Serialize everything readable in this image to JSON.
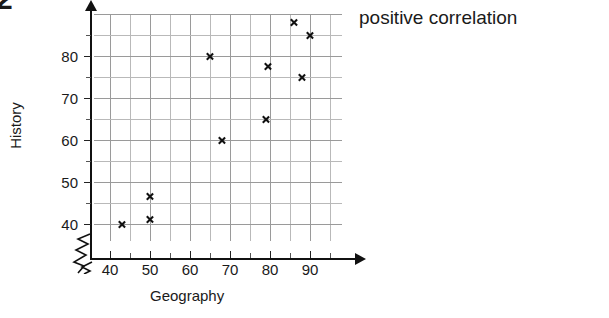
{
  "question_number": "2",
  "conclusion_text": "positive correlation",
  "chart_data": {
    "type": "scatter",
    "title": "",
    "xlabel": "Geography",
    "ylabel": "History",
    "xlim": [
      36,
      100
    ],
    "ylim": [
      36,
      90
    ],
    "xticks": [
      40,
      50,
      60,
      70,
      80,
      90
    ],
    "yticks": [
      40,
      50,
      60,
      70,
      80
    ],
    "xtick_labels": [
      "40",
      "50",
      "60",
      "70",
      "80",
      "90"
    ],
    "ytick_labels": [
      "40",
      "50",
      "60",
      "70",
      "80"
    ],
    "minor_tick_step": 5,
    "grid": true,
    "axis_break": true,
    "legend": "none",
    "marker": "x",
    "marker_color": "#111111",
    "grid_color": "#b9b9b9",
    "axis_color": "#111111",
    "points": [
      {
        "x": 43,
        "y": 40
      },
      {
        "x": 50,
        "y": 41
      },
      {
        "x": 50,
        "y": 46.5
      },
      {
        "x": 65,
        "y": 80
      },
      {
        "x": 68,
        "y": 60
      },
      {
        "x": 79,
        "y": 65
      },
      {
        "x": 79.5,
        "y": 77.5
      },
      {
        "x": 86,
        "y": 88
      },
      {
        "x": 88,
        "y": 75
      },
      {
        "x": 90,
        "y": 85
      }
    ],
    "series": [
      {
        "name": "students",
        "x": [
          43,
          50,
          50,
          65,
          68,
          79,
          79.5,
          86,
          88,
          90
        ],
        "y": [
          40,
          41,
          46.5,
          80,
          60,
          65,
          77.5,
          88,
          75,
          85
        ]
      }
    ]
  }
}
